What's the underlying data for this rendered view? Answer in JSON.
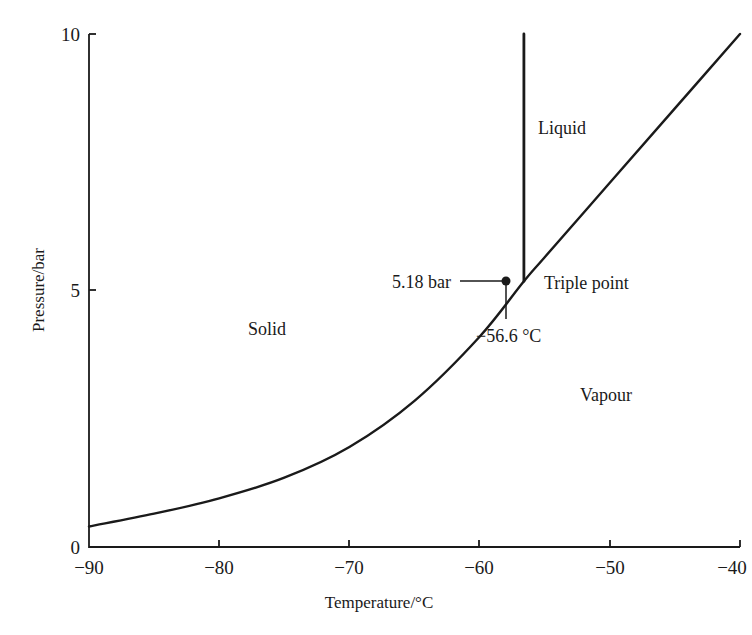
{
  "header": {
    "clipped_title": "Phase diagram of carbon dioxide near the triple point"
  },
  "chart_data": {
    "type": "line",
    "title": "",
    "xlabel": "Temperature/°C",
    "ylabel": "Pressure/bar",
    "xlim": [
      -90,
      -40
    ],
    "ylim": [
      0,
      10
    ],
    "x_ticks": [
      -90,
      -80,
      -70,
      -60,
      -50,
      -40
    ],
    "x_tick_labels": [
      "−90",
      "−80",
      "−70",
      "−60",
      "−50",
      "−40"
    ],
    "y_ticks": [
      0,
      5,
      10
    ],
    "y_tick_labels": [
      "0",
      "5",
      "10"
    ],
    "grid": false,
    "legend": null,
    "series": [
      {
        "name": "Sublimation/vaporization curve (solid–vapour & liquid–vapour boundary)",
        "x": [
          -90,
          -85,
          -80,
          -75,
          -70,
          -65,
          -60,
          -56.6,
          -55,
          -50,
          -45,
          -40
        ],
        "y": [
          0.4,
          0.65,
          0.95,
          1.35,
          1.95,
          2.85,
          4.1,
          5.18,
          5.65,
          7.1,
          8.55,
          10.0
        ]
      },
      {
        "name": "Melting curve (solid–liquid boundary)",
        "x": [
          -56.6,
          -56.6
        ],
        "y": [
          5.18,
          10.0
        ]
      }
    ],
    "region_labels": [
      {
        "text": "Solid",
        "x": -76,
        "y": 4.5
      },
      {
        "text": "Liquid",
        "x": -54,
        "y": 8.2
      },
      {
        "text": "Vapour",
        "x": -48.5,
        "y": 2.9
      }
    ],
    "annotations": [
      {
        "text": "5.18 bar",
        "x": -56.6,
        "y": 5.18,
        "kind": "pressure-leader"
      },
      {
        "text": "−56.6 °C",
        "x": -56.6,
        "y": 5.18,
        "kind": "temperature-leader"
      },
      {
        "text": "Triple point",
        "x": -56.6,
        "y": 5.18,
        "kind": "point-label"
      }
    ],
    "triple_point": {
      "temperature_c": -56.6,
      "pressure_bar": 5.18
    }
  },
  "colors": {
    "ink": "#1a1a1a",
    "background": "#ffffff"
  }
}
